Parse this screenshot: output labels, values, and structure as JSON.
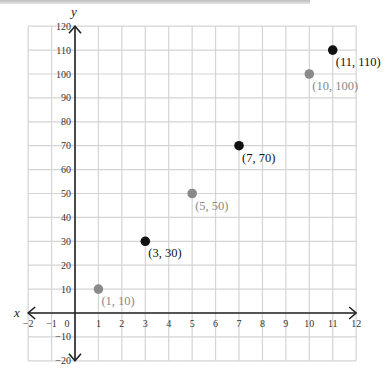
{
  "chart_data": {
    "type": "scatter",
    "title": "",
    "xlabel": "x",
    "ylabel": "y",
    "xlim": [
      -2,
      12
    ],
    "ylim": [
      -20,
      120
    ],
    "grid": true,
    "x_ticks": [
      "−2",
      "−1",
      "0",
      "1",
      "2",
      "3",
      "4",
      "5",
      "6",
      "7",
      "8",
      "9",
      "10",
      "11",
      "12"
    ],
    "y_ticks": [
      "120",
      "110",
      "100",
      "90",
      "80",
      "70",
      "60",
      "50",
      "40",
      "30",
      "20",
      "10",
      "−10",
      "−20"
    ],
    "points": [
      {
        "x": 1,
        "y": 10,
        "label": "(1, 10)",
        "color": "#8a8a8a"
      },
      {
        "x": 3,
        "y": 30,
        "label": "(3, 30)",
        "color": "#111111"
      },
      {
        "x": 5,
        "y": 50,
        "label": "(5, 50)",
        "color": "#8a8a8a"
      },
      {
        "x": 7,
        "y": 70,
        "label": "(7, 70)",
        "color": "#111111"
      },
      {
        "x": 10,
        "y": 100,
        "label": "(10, 100)",
        "color": "#8a8a8a"
      },
      {
        "x": 11,
        "y": 110,
        "label": "(11, 110)",
        "color": "#111111"
      }
    ]
  },
  "colors": {
    "grid": "#d4d4d4",
    "axis": "#222222",
    "gray_point": "#8a8a8a",
    "black_point": "#111111"
  }
}
